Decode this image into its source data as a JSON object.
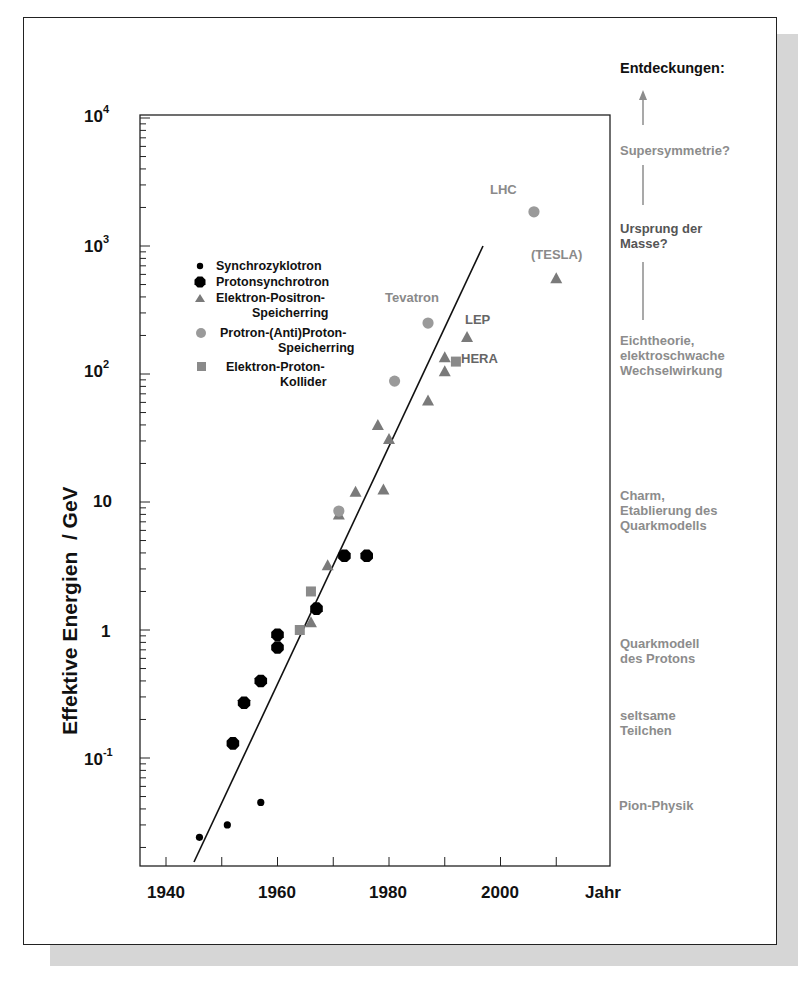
{
  "chart_data": {
    "type": "scatter",
    "title": "",
    "xlabel": "Jahr",
    "ylabel": "Effektive Energien  / GeV",
    "xlim": [
      1935,
      2020
    ],
    "ylim": [
      0.014,
      10000
    ],
    "yscale": "log",
    "grid": false,
    "legend_position": "upper-left inside plot",
    "x_ticks": [
      {
        "value": 1940,
        "label": "1940"
      },
      {
        "value": 1960,
        "label": "1960"
      },
      {
        "value": 1980,
        "label": "1980"
      },
      {
        "value": 2000,
        "label": "2000"
      }
    ],
    "y_ticks": [
      {
        "value": 10000,
        "label": "10",
        "sup": "4"
      },
      {
        "value": 1000,
        "label": "10",
        "sup": "3"
      },
      {
        "value": 100,
        "label": "10",
        "sup": "2"
      },
      {
        "value": 10,
        "label": "10",
        "sup": ""
      },
      {
        "value": 1,
        "label": "1",
        "sup": ""
      },
      {
        "value": 0.1,
        "label": "10",
        "sup": "-1"
      }
    ],
    "series": [
      {
        "name": "Synchrozyklotron",
        "marker": "small-circle",
        "color": "#000000",
        "points": [
          [
            1946,
            0.024
          ],
          [
            1951,
            0.03
          ],
          [
            1957,
            0.045
          ]
        ]
      },
      {
        "name": "Protonsynchrotron",
        "marker": "large-octagon",
        "color": "#000000",
        "points": [
          [
            1952,
            0.13
          ],
          [
            1954,
            0.27
          ],
          [
            1957,
            0.4
          ],
          [
            1960,
            0.92
          ],
          [
            1960,
            0.73
          ],
          [
            1967,
            1.47
          ],
          [
            1972,
            3.8
          ],
          [
            1976,
            3.8
          ]
        ]
      },
      {
        "name": "Elektron-Positron-Speicherring",
        "marker": "triangle",
        "color": "#7a7a7a",
        "points": [
          [
            1966,
            1.15
          ],
          [
            1969,
            3.2
          ],
          [
            1971,
            8.0
          ],
          [
            1974,
            12
          ],
          [
            1978,
            40
          ],
          [
            1980,
            31
          ],
          [
            1979,
            12.5
          ],
          [
            1987,
            62
          ],
          [
            1990,
            105
          ],
          [
            1990,
            135
          ],
          [
            1994,
            195
          ],
          [
            2010,
            560
          ]
        ]
      },
      {
        "name": "Protron-(Anti)Proton-Speicherring",
        "marker": "circle",
        "color": "#9a9a9a",
        "points": [
          [
            1971,
            8.5
          ],
          [
            1981,
            88
          ],
          [
            1987,
            250
          ],
          [
            2006,
            1850
          ]
        ]
      },
      {
        "name": "Elektron-Proton-Kollider",
        "marker": "square",
        "color": "#8a8a8a",
        "points": [
          [
            1964,
            1.0
          ],
          [
            1966,
            2.0
          ],
          [
            1992,
            125
          ]
        ]
      }
    ],
    "trend_line": {
      "from": [
        1945,
        0.025
      ],
      "to": [
        1997,
        900
      ]
    },
    "annotations": [
      {
        "text": "LHC",
        "x": 2006,
        "y": 1850
      },
      {
        "text": "(TESLA)",
        "x": 2010,
        "y": 560
      },
      {
        "text": "Tevatron",
        "x": 1987,
        "y": 250
      },
      {
        "text": "LEP",
        "x": 1994,
        "y": 195
      },
      {
        "text": "HERA",
        "x": 1992,
        "y": 125
      }
    ]
  },
  "legend": {
    "items": [
      {
        "line1": "Synchrozyklotron",
        "line2": ""
      },
      {
        "line1": "Protonsynchrotron",
        "line2": ""
      },
      {
        "line1": "Elektron-Positron-",
        "line2": "Speicherring"
      },
      {
        "line1": "Protron-(Anti)Proton-",
        "line2": "Speicherring"
      },
      {
        "line1": "Elektron-Proton-",
        "line2": "Kollider"
      }
    ]
  },
  "discoveries": {
    "title": "Entdeckungen:",
    "items": [
      {
        "lines": [
          "Supersymmetrie?"
        ]
      },
      {
        "lines": [
          "Ursprung der",
          "Masse?"
        ]
      },
      {
        "lines": [
          "Eichtheorie,",
          "elektroschwache",
          "Wechselwirkung"
        ]
      },
      {
        "lines": [
          "Charm,",
          "Etablierung des",
          "Quarkmodells"
        ]
      },
      {
        "lines": [
          "Quarkmodell",
          "des Protons"
        ]
      },
      {
        "lines": [
          "seltsame",
          "Teilchen"
        ]
      },
      {
        "lines": [
          "Pion-Physik"
        ]
      }
    ]
  },
  "axis": {
    "x_title": "Jahr",
    "y_title": "Effektive Energien  / GeV",
    "x_labels": [
      "1940",
      "1960",
      "1980",
      "2000"
    ],
    "y_labels": {
      "e4": {
        "base": "10",
        "exp": "4"
      },
      "e3": {
        "base": "10",
        "exp": "3"
      },
      "e2": {
        "base": "10",
        "exp": "2"
      },
      "e1": {
        "base": "10"
      },
      "e0": {
        "base": "1"
      },
      "em1": {
        "base": "10",
        "exp": "-1"
      }
    }
  },
  "labels": {
    "lhc": "LHC",
    "tesla": "(TESLA)",
    "tevatron": "Tevatron",
    "lep": "LEP",
    "hera": "HERA"
  }
}
